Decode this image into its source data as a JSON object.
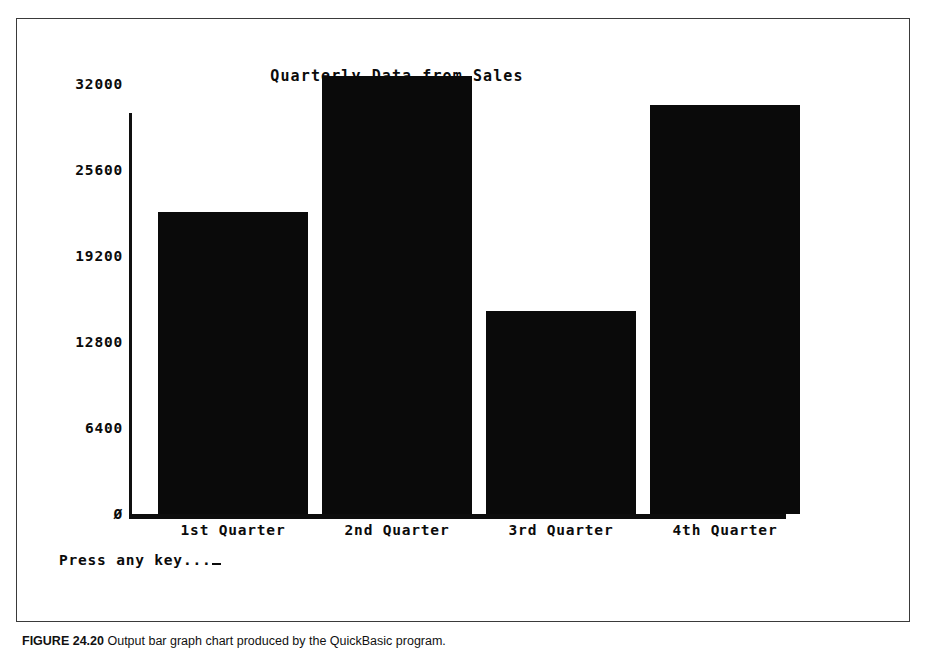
{
  "chart_data": {
    "type": "bar",
    "title": "Quarterly Data from Sales",
    "xlabel": "",
    "ylabel": "",
    "categories": [
      "1st Quarter",
      "2nd Quarter",
      "3rd Quarter",
      "4th Quarter"
    ],
    "values": [
      22500,
      32600,
      15100,
      30400
    ],
    "ylim": [
      0,
      32600
    ],
    "ytick_labels": [
      "32000",
      "25600",
      "19200",
      "12800",
      "6400",
      "Ø"
    ],
    "ytick_values": [
      32000,
      25600,
      19200,
      12800,
      6400,
      0
    ],
    "grid": false,
    "legend": null,
    "bar_color": "#0a0a0a",
    "axis_color": "#0d0d0d",
    "background": "#ffffff"
  },
  "screen": {
    "prompt_text": "Press any key...",
    "cursor": "_"
  },
  "figure": {
    "caption_label": "FIGURE 24.20",
    "caption_text": "Output bar graph chart produced by the QuickBasic program."
  }
}
